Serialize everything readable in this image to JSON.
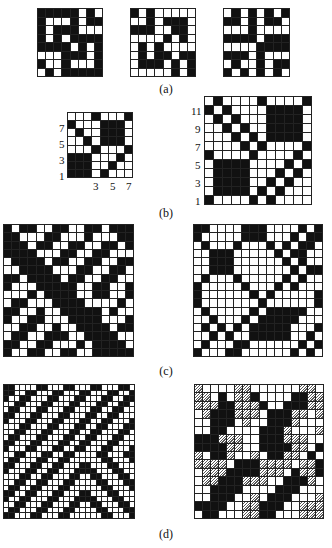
{
  "figure": {
    "labels": {
      "a": "(a)",
      "b": "(b)",
      "c": "(c)",
      "d": "(d)"
    },
    "grids": {
      "a1": {
        "rows": [
          "11111010",
          "10001011",
          "10111000",
          "10101111",
          "11110101",
          "00011101",
          "10010001",
          "01011111"
        ]
      },
      "a2": {
        "rows": [
          "10100000",
          "00101110",
          "11100110",
          "00001010",
          "01010000",
          "01011011",
          "01110101",
          "00000101"
        ]
      },
      "a3": {
        "rows": [
          "01010101",
          "11010110",
          "00010000",
          "11110111",
          "00001111",
          "11101000",
          "01001011",
          "10101010"
        ]
      },
      "b1": {
        "rows": [
          "00010001",
          "10001110",
          "01001110",
          "00101110",
          "00010001",
          "11100010",
          "11100100",
          "11101000"
        ],
        "y_ticks": [
          "7",
          "5",
          "3",
          "1"
        ],
        "x_ticks": [
          "3",
          "5",
          "7"
        ]
      },
      "b2": {
        "rows": [
          "010000100001",
          "101000011110",
          "010100011110",
          "001010011110",
          "000101011110",
          "000010100001",
          "100001000010",
          "011110000101",
          "011110001010",
          "011110010100",
          "011110101000",
          "100001010000"
        ],
        "y_ticks": [
          "11",
          "9",
          "7",
          "5",
          "3",
          "1"
        ]
      },
      "c1": {
        "rows": [
          "1011001100110111",
          "1100011000100011",
          "1110110011001101",
          "1111000110011000",
          "0111101100110011",
          "0011110001100110",
          "1101111011001100",
          "1000111110011001",
          "0001011110011001",
          "0110001111000010",
          "1100100111110100",
          "1001100011110001",
          "0011001001111011",
          "0110011100111100",
          "1100110001011110",
          "1001100110011111"
        ]
      },
      "c2": {
        "rows": [
          "1100001110000101",
          "1000001110001011",
          "0100010001010110",
          "0011100000101100",
          "0011100000010100",
          "0011100000001011",
          "0100010000010100",
          "1000001000101000",
          "1000000101000001",
          "1000000010000001",
          "0100000101111100",
          "0010001011111000",
          "0101010111110001",
          "0010100111110010",
          "0100011000000101",
          "1000110000001010"
        ]
      },
      "d1": {
        "rows": [
          "110000110001100011000110",
          "110011000110001100011001",
          "100110001100011000110011",
          "001100011000110001100110",
          "011000110001100011001100",
          "110001100011000110011000",
          "100011000110001100110001",
          "000110001100011001100011",
          "001100011000110011000110",
          "011000110001100110001100",
          "110001100011001100011000",
          "100011000110011000110001",
          "001100011001100001100011",
          "011000110011000000110001",
          "110001100110001100011000",
          "100011001100011110001100",
          "000110011000110011000110",
          "001100110001100001100011",
          "011001100011000000110001",
          "110011000110001100011000",
          "100110001100011110001100",
          "001100011000110011000110",
          "011000110001100001100011",
          "110001100011000000110001"
        ]
      },
      "d2": {
        "rows": [
          "2000022000000220",
          "2201022100001122",
          "2221122210011122",
          "0211122201112202",
          "0011102001112000",
          "0011000011120002",
          "1112220011122200",
          "1111220011112201",
          "2011200201122010",
          "2222011122220221",
          "0222111122201221",
          "0221112220011120",
          "0011110000111000",
          "0011100201110002",
          "1111002211100222",
          "0110002211000222"
        ]
      }
    }
  }
}
